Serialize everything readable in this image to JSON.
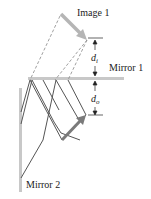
{
  "diagram": {
    "labels": {
      "image1": "Image 1",
      "mirror1": "Mirror 1",
      "mirror2": "Mirror 2",
      "di_main": "d",
      "di_sub": "i",
      "do_main": "d",
      "do_sub": "o"
    },
    "colors": {
      "mirror": "#c8c8c8",
      "ray": "#555555",
      "dashed_ray": "#888888",
      "object_arrow": "#7a7a7a",
      "image_arrow": "#b5b5b5",
      "dimension": "#222222"
    }
  }
}
